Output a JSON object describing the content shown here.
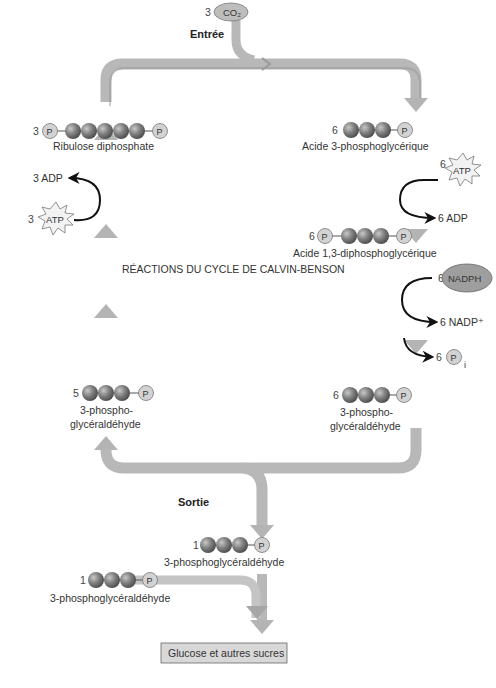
{
  "title_fragment": "",
  "colors": {
    "arrow": "#b8b8b8",
    "arrow_shade": "#9a9a9a",
    "carbon_ball": "#7a7a7a",
    "phosphate": "#cfcfcf",
    "nadph": "#9e9e9e",
    "atp_burst": "#f2f2f2",
    "product_box": "#d8d8d8"
  },
  "input": {
    "co2_count": "3",
    "co2_label": "CO₂",
    "entry_label": "Entrée"
  },
  "center_label": "RÉACTIONS DU CYCLE DE CALVIN-BENSON",
  "molecules": {
    "rubp": {
      "count": "3",
      "name": "Ribulose diphosphate",
      "carbons": 5,
      "phosphate_symbol": "P"
    },
    "pga": {
      "count": "6",
      "name": "Acide 3-phosphoglycérique",
      "carbons": 3,
      "phosphate_symbol": "P"
    },
    "bpga": {
      "count": "6",
      "name": "Acide 1,3-diphosphoglycérique",
      "carbons": 3,
      "phosphate_symbol": "P"
    },
    "g3p_right": {
      "count": "6",
      "name_line1": "3-phospho-",
      "name_line2": "glycéraldéhyde",
      "carbons": 3,
      "phosphate_symbol": "P"
    },
    "g3p_left": {
      "count": "5",
      "name_line1": "3-phospho-",
      "name_line2": "glycéraldéhyde",
      "carbons": 3,
      "phosphate_symbol": "P"
    },
    "g3p_out": {
      "count": "1",
      "name": "3-phosphoglycéraldéhyde",
      "carbons": 3,
      "phosphate_symbol": "P"
    },
    "g3p_out2": {
      "count": "1",
      "name": "3-phosphoglycéraldéhyde",
      "carbons": 3,
      "phosphate_symbol": "P"
    }
  },
  "cofactors": {
    "atp_right": {
      "count": "6",
      "label": "ATP"
    },
    "adp_right": {
      "label": "6 ADP"
    },
    "nadph": {
      "count": "6",
      "label": "NADPH"
    },
    "nadp": {
      "label": "6 NADP⁺"
    },
    "pi": {
      "count": "6",
      "symbol": "P",
      "subscript": "i"
    },
    "atp_left": {
      "count": "3",
      "label": "ATP"
    },
    "adp_left": {
      "label": "3 ADP"
    }
  },
  "output": {
    "exit_label": "Sortie",
    "product_box": "Glucose et autres sucres"
  }
}
